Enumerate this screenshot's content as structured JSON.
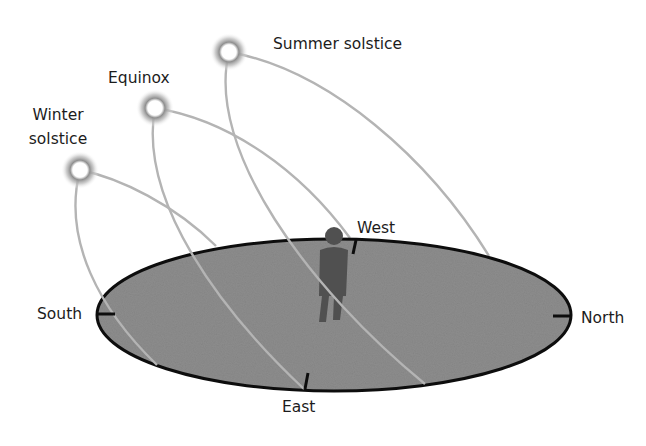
{
  "diagram": {
    "sun_paths": [
      {
        "id": "winter",
        "label_lines": [
          "Winter",
          "solstice"
        ]
      },
      {
        "id": "equinox",
        "label_lines": [
          "Equinox"
        ]
      },
      {
        "id": "summer",
        "label_lines": [
          "Summer solstice"
        ]
      }
    ],
    "directions": {
      "south": "South",
      "north": "North",
      "east": "East",
      "west": "West"
    },
    "colors": {
      "ground_fill": "#8d8d8d",
      "ground_outline": "#0d0d0d",
      "path_stroke": "#b4b4b4",
      "person": "#505050",
      "sun_glow": "#9a9a9a",
      "sun_core": "#ffffff",
      "label_text": "#1c1c1c"
    }
  }
}
